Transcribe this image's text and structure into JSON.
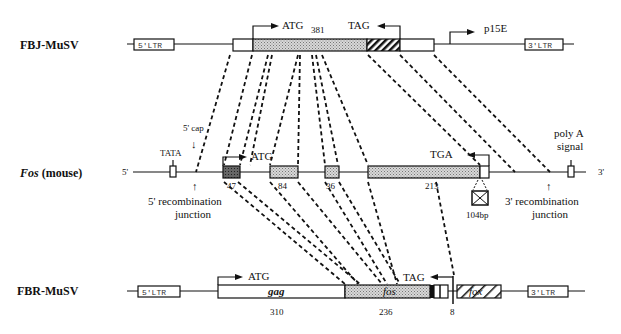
{
  "rows": {
    "fbj": {
      "label": "FBJ-MuSV",
      "ltr5": "5'LTR",
      "ltr3": "3'LTR",
      "atg": "ATG",
      "tag": "TAG",
      "length": "381",
      "promoter": "p15E"
    },
    "fos": {
      "label_italic": "Fos",
      "label_rest": " (mouse)",
      "end5": "5'",
      "end3": "3'",
      "tata": "TATA",
      "cap": "5' cap",
      "atg": "ATG",
      "tga": "TGA",
      "polyA_line1": "poly A",
      "polyA_line2": "signal",
      "exon_sizes": [
        "47",
        "84",
        "36",
        "213"
      ],
      "insert": "104bp",
      "junction5_line1": "5' recombination",
      "junction5_line2": "junction",
      "junction3_line1": "3' recombination",
      "junction3_line2": "junction"
    },
    "fbr": {
      "label": "FBR-MuSV",
      "ltr5": "5'LTR",
      "ltr3": "3'LTR",
      "atg": "ATG",
      "tag": "TAG",
      "gag": "gag",
      "fos": "fos",
      "fox": "fox",
      "sizes": [
        "310",
        "236",
        "8"
      ]
    }
  }
}
